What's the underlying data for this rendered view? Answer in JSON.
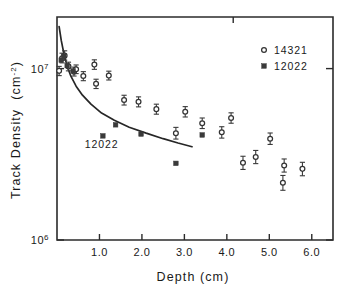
{
  "chart_data": {
    "type": "scatter",
    "title": "",
    "xlabel": "Depth (cm)",
    "ylabel": "Track Density (cm-2)",
    "ylabel_main": "Track Density",
    "ylabel_unit": "(cm",
    "ylabel_unit_exp": "-2",
    "ylabel_unit_close": ")",
    "xlim": [
      0.0,
      6.5
    ],
    "ylim": [
      1000000,
      20000000
    ],
    "yscale": "log",
    "xscale": "linear",
    "grid": false,
    "xticks": [
      1.0,
      2.0,
      3.0,
      4.0,
      5.0,
      6.0
    ],
    "xticklabels": [
      "1.0",
      "2.0",
      "3.0",
      "4.0",
      "5.0",
      "6.0"
    ],
    "yticks": [
      1000000,
      10000000
    ],
    "yticklabels": [
      "10",
      "10"
    ],
    "ytick_exponents": [
      "6",
      "7"
    ],
    "legend_position": "top-right",
    "legend": [
      {
        "label": "14321",
        "marker": "open-circle"
      },
      {
        "label": "12022",
        "marker": "filled-square"
      }
    ],
    "annotations": [
      {
        "text": "12022",
        "x": 1.05,
        "y": 3450000,
        "note": "curve label"
      }
    ],
    "series": [
      {
        "name": "14321",
        "marker": "open-circle",
        "has_error_bars": true,
        "points": [
          {
            "x": 0.05,
            "y": 9700000,
            "yerr_lo": 600000,
            "yerr_hi": 600000
          },
          {
            "x": 0.12,
            "y": 11500000,
            "yerr_lo": 700000,
            "yerr_hi": 800000
          },
          {
            "x": 0.18,
            "y": 11900000,
            "yerr_lo": 700000,
            "yerr_hi": 800000
          },
          {
            "x": 0.27,
            "y": 10300000,
            "yerr_lo": 600000,
            "yerr_hi": 600000
          },
          {
            "x": 0.4,
            "y": 9600000,
            "yerr_lo": 550000,
            "yerr_hi": 600000
          },
          {
            "x": 0.45,
            "y": 9900000,
            "yerr_lo": 550000,
            "yerr_hi": 600000
          },
          {
            "x": 0.62,
            "y": 9050000,
            "yerr_lo": 550000,
            "yerr_hi": 550000
          },
          {
            "x": 0.88,
            "y": 10550000,
            "yerr_lo": 650000,
            "yerr_hi": 700000
          },
          {
            "x": 0.92,
            "y": 8150000,
            "yerr_lo": 500000,
            "yerr_hi": 520000
          },
          {
            "x": 1.22,
            "y": 9100000,
            "yerr_lo": 520000,
            "yerr_hi": 560000
          },
          {
            "x": 1.58,
            "y": 6550000,
            "yerr_lo": 420000,
            "yerr_hi": 440000
          },
          {
            "x": 1.92,
            "y": 6400000,
            "yerr_lo": 420000,
            "yerr_hi": 440000
          },
          {
            "x": 2.34,
            "y": 5800000,
            "yerr_lo": 380000,
            "yerr_hi": 400000
          },
          {
            "x": 2.8,
            "y": 4200000,
            "yerr_lo": 320000,
            "yerr_hi": 340000
          },
          {
            "x": 3.02,
            "y": 5600000,
            "yerr_lo": 380000,
            "yerr_hi": 400000
          },
          {
            "x": 3.42,
            "y": 4800000,
            "yerr_lo": 330000,
            "yerr_hi": 350000
          },
          {
            "x": 3.88,
            "y": 4250000,
            "yerr_lo": 320000,
            "yerr_hi": 330000
          },
          {
            "x": 4.1,
            "y": 5150000,
            "yerr_lo": 350000,
            "yerr_hi": 370000
          },
          {
            "x": 4.38,
            "y": 2820000,
            "yerr_lo": 240000,
            "yerr_hi": 260000
          },
          {
            "x": 4.68,
            "y": 3050000,
            "yerr_lo": 260000,
            "yerr_hi": 280000
          },
          {
            "x": 5.02,
            "y": 3900000,
            "yerr_lo": 290000,
            "yerr_hi": 310000
          },
          {
            "x": 5.32,
            "y": 2160000,
            "yerr_lo": 210000,
            "yerr_hi": 220000
          },
          {
            "x": 5.35,
            "y": 2720000,
            "yerr_lo": 230000,
            "yerr_hi": 250000
          },
          {
            "x": 5.78,
            "y": 2600000,
            "yerr_lo": 230000,
            "yerr_hi": 240000
          }
        ]
      },
      {
        "name": "12022",
        "marker": "filled-square",
        "has_error_bars": false,
        "points": [
          {
            "x": 0.1,
            "y": 11200000
          },
          {
            "x": 0.16,
            "y": 11800000
          },
          {
            "x": 0.24,
            "y": 10400000
          },
          {
            "x": 0.38,
            "y": 9700000
          },
          {
            "x": 1.08,
            "y": 4050000
          },
          {
            "x": 1.38,
            "y": 4700000
          },
          {
            "x": 1.98,
            "y": 4150000
          },
          {
            "x": 2.8,
            "y": 2800000
          },
          {
            "x": 3.42,
            "y": 4100000
          }
        ]
      }
    ],
    "curves": [
      {
        "name": "12022 model",
        "label": "12022",
        "style": "solid",
        "points": [
          {
            "x": 0.05,
            "y": 17600000
          },
          {
            "x": 0.1,
            "y": 14600000
          },
          {
            "x": 0.16,
            "y": 12300000
          },
          {
            "x": 0.24,
            "y": 10300000
          },
          {
            "x": 0.33,
            "y": 9000000
          },
          {
            "x": 0.45,
            "y": 7900000
          },
          {
            "x": 0.6,
            "y": 7000000
          },
          {
            "x": 0.8,
            "y": 6200000
          },
          {
            "x": 1.05,
            "y": 5500000
          },
          {
            "x": 1.35,
            "y": 5000000
          },
          {
            "x": 1.7,
            "y": 4550000
          },
          {
            "x": 2.1,
            "y": 4200000
          },
          {
            "x": 2.5,
            "y": 3900000
          },
          {
            "x": 2.85,
            "y": 3680000
          },
          {
            "x": 3.18,
            "y": 3500000
          }
        ]
      }
    ]
  }
}
